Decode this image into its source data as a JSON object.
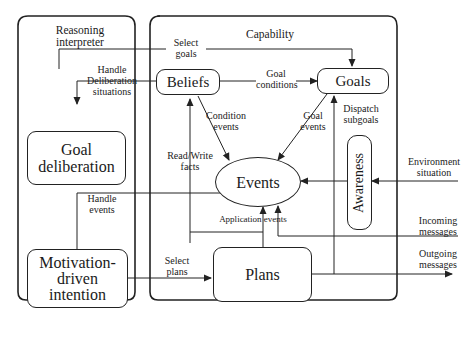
{
  "diagram": {
    "containers": {
      "reasoning_interpreter": {
        "title_line1": "Reasoning",
        "title_line2": "interpreter"
      },
      "capability": {
        "title": "Capability"
      }
    },
    "nodes": {
      "beliefs": "Beliefs",
      "goals": "Goals",
      "goal_deliberation_line1": "Goal",
      "goal_deliberation_line2": "deliberation",
      "events": "Events",
      "awareness": "Awareness",
      "motivation_line1": "Motivation-",
      "motivation_line2": "driven",
      "motivation_line3": "intention",
      "plans": "Plans"
    },
    "edges": {
      "select_goals_1": "Select",
      "select_goals_2": "goals",
      "handle_delib_1": "Handle",
      "handle_delib_2": "Deliberation",
      "handle_delib_3": "situations",
      "goal_conditions_1": "Goal",
      "goal_conditions_2": "conditions",
      "condition_events_1": "Condition",
      "condition_events_2": "events",
      "goal_events_1": "Goal",
      "goal_events_2": "events",
      "dispatch_subgoals_1": "Dispatch",
      "dispatch_subgoals_2": "subgoals",
      "read_write_1": "Read/Write",
      "read_write_2": "facts",
      "handle_events_1": "Handle",
      "handle_events_2": "events",
      "application_events": "Application events",
      "select_plans_1": "Select",
      "select_plans_2": "plans",
      "environment_1": "Environment",
      "environment_2": "situation",
      "incoming_1": "Incoming",
      "incoming_2": "messages",
      "outgoing_1": "Outgoing",
      "outgoing_2": "messages"
    },
    "colors": {
      "stroke": "#222222",
      "background": "#ffffff"
    }
  }
}
